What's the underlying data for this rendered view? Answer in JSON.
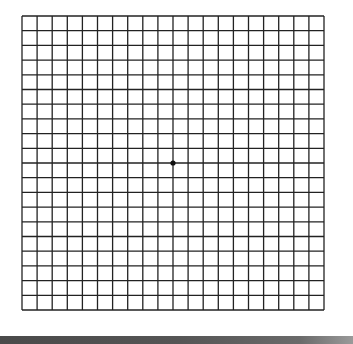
{
  "diagram": {
    "type": "amsler-grid",
    "columns": 20,
    "rows": 20,
    "line_color": "#222222",
    "background_color": "#ffffff",
    "center_dot": {
      "column_line": 10,
      "row_line": 10,
      "color": "#111111",
      "radius": 2.6
    }
  },
  "bottom_bar": {
    "color": "#555555"
  }
}
